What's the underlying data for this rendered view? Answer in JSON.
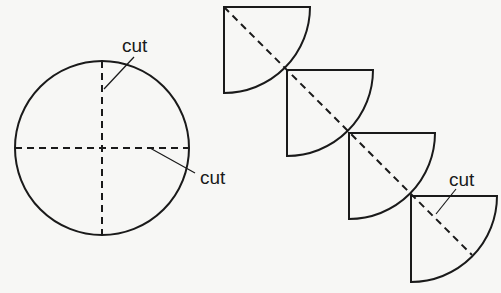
{
  "diagram": {
    "type": "cutting-diagram",
    "colors": {
      "stroke": "#1a1a1a",
      "background": "#f7f7f5"
    },
    "circle": {
      "center": [
        102,
        148
      ],
      "radius": 87,
      "cut_lines": [
        "vertical-diameter",
        "horizontal-diameter"
      ],
      "labels": [
        {
          "text": "cut",
          "x": 126,
          "y": 52,
          "leader": [
            [
              134,
              57
            ],
            [
              104,
              89
            ]
          ]
        },
        {
          "text": "cut",
          "x": 198,
          "y": 216,
          "leader": [
            [
              150,
              147
            ],
            [
              194,
              172
            ]
          ]
        }
      ]
    },
    "quarter_circles": [
      {
        "corner": [
          224,
          7
        ],
        "radius": 86
      },
      {
        "corner": [
          287,
          70
        ],
        "radius": 86
      },
      {
        "corner": [
          349,
          133
        ],
        "radius": 86
      },
      {
        "corner": [
          411,
          196
        ],
        "radius": 86
      }
    ],
    "diagonal_cut": {
      "from": [
        224,
        7
      ],
      "to": [
        474,
        257
      ]
    },
    "quarter_label": {
      "text": "cut",
      "x": 450,
      "y": 183,
      "leader": [
        [
          456,
          188
        ],
        [
          436,
          213
        ]
      ]
    }
  }
}
